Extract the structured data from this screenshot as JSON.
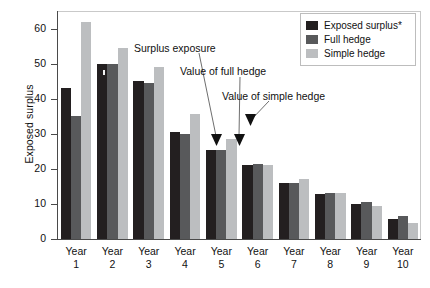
{
  "chart_data": {
    "type": "bar",
    "title": "",
    "xlabel": "",
    "ylabel": "Exposed surplus",
    "ylim": [
      0,
      65
    ],
    "yticks": [
      0,
      10,
      20,
      30,
      40,
      50,
      60
    ],
    "grid": false,
    "legend_position": "top-right",
    "categories": [
      "Year 1",
      "Year 2",
      "Year 3",
      "Year 4",
      "Year 5",
      "Year 6",
      "Year 7",
      "Year 8",
      "Year 9",
      "Year 10"
    ],
    "series": [
      {
        "name": "Exposed surplus*",
        "color": "#231f20",
        "values": [
          43,
          50,
          45,
          30.5,
          25.5,
          21,
          16,
          12.8,
          10,
          5.8
        ]
      },
      {
        "name": "Full hedge",
        "color": "#58595b",
        "values": [
          35,
          50,
          44.5,
          30,
          25.5,
          21.5,
          16,
          13.2,
          10.5,
          6.6
        ]
      },
      {
        "name": "Simple hedge",
        "color": "#bcbec0",
        "values": [
          62,
          54.5,
          49,
          35.5,
          28.5,
          21,
          17,
          13.2,
          9.3,
          4.6
        ]
      }
    ],
    "annotations": [
      {
        "text": "Surplus exposure",
        "points_to": "Year 5 / Exposed surplus*"
      },
      {
        "text": "Value of full hedge",
        "points_to": "Year 5 / Full hedge"
      },
      {
        "text": "Value of simple hedge",
        "points_to": "Year 5 / Simple hedge"
      }
    ]
  },
  "yaxis": {
    "title": "Exposed surplus",
    "ticks": [
      "0",
      "10",
      "20",
      "30",
      "40",
      "50",
      "60"
    ]
  },
  "xaxis": {
    "labels": [
      {
        "line1": "Year",
        "line2": "1"
      },
      {
        "line1": "Year",
        "line2": "2"
      },
      {
        "line1": "Year",
        "line2": "3"
      },
      {
        "line1": "Year",
        "line2": "4"
      },
      {
        "line1": "Year",
        "line2": "5"
      },
      {
        "line1": "Year",
        "line2": "6"
      },
      {
        "line1": "Year",
        "line2": "7"
      },
      {
        "line1": "Year",
        "line2": "8"
      },
      {
        "line1": "Year",
        "line2": "9"
      },
      {
        "line1": "Year",
        "line2": "10"
      }
    ]
  },
  "legend": {
    "items": [
      {
        "label": "Exposed surplus*",
        "color": "#231f20"
      },
      {
        "label": "Full hedge",
        "color": "#58595b"
      },
      {
        "label": "Simple hedge",
        "color": "#bcbec0"
      }
    ]
  },
  "annotations": {
    "surplus_exposure": "Surplus exposure",
    "value_full_hedge": "Value of full hedge",
    "value_simple_hedge": "Value of simple hedge"
  }
}
